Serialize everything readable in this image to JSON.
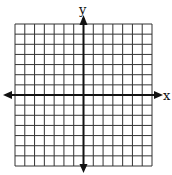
{
  "diagram": {
    "type": "coordinate-plane",
    "grid": {
      "columns": 14,
      "rows": 14,
      "line_color": "#333333",
      "axis_color": "#111111"
    },
    "axes": {
      "x_label": "x",
      "y_label": "y",
      "origin_col": 7,
      "origin_row": 7,
      "arrows": [
        "left",
        "right",
        "up",
        "down"
      ]
    }
  }
}
